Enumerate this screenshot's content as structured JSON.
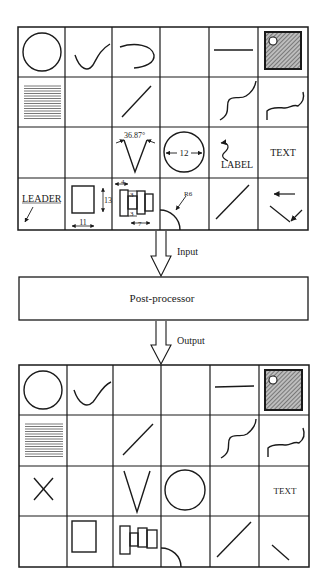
{
  "diagram": {
    "input_label": "Input",
    "output_label": "Output",
    "processor_label": "Post-processor",
    "input_grid": {
      "annotations": {
        "angle": "36.87°",
        "diameter": "12",
        "label": "LABEL",
        "text": "TEXT",
        "leader": "LEADER",
        "rect_height": "13",
        "rect_width": "11",
        "dim_4": "4",
        "dim_3a": "3",
        "dim_3b": "3",
        "dim_7": "7",
        "radius": "R6"
      }
    },
    "output_grid": {
      "annotations": {
        "text": "TEXT"
      }
    }
  }
}
